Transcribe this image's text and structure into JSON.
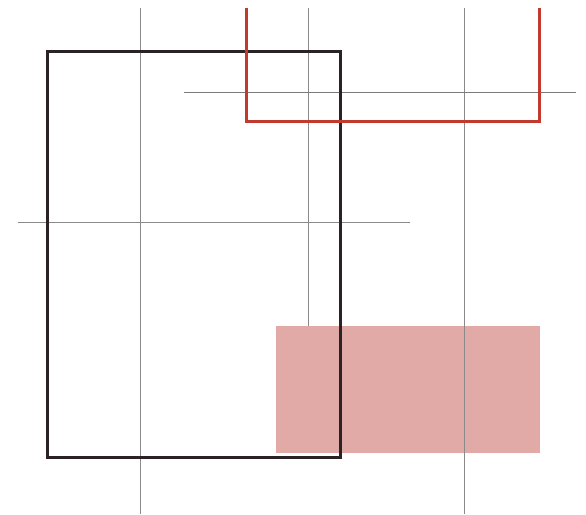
{
  "composition": {
    "title": "Abstract geometric composition",
    "background": "#ffffff",
    "colors": {
      "grid_line": "#8a8a8a",
      "black_frame": "#2a2224",
      "red_frame": "#c23a2e",
      "pink_fill": "#e2aaa6"
    },
    "shapes": [
      {
        "type": "vertical-line",
        "x": 140,
        "y1": 8,
        "y2": 514
      },
      {
        "type": "vertical-line",
        "x": 308,
        "y1": 8,
        "y2": 326
      },
      {
        "type": "vertical-line",
        "x": 464,
        "y1": 8,
        "y2": 514
      },
      {
        "type": "horizontal-line",
        "y": 92,
        "x1": 184,
        "x2": 576
      },
      {
        "type": "horizontal-line",
        "y": 222,
        "x1": 18,
        "x2": 410
      },
      {
        "type": "pink-rect",
        "x": 276,
        "y": 326,
        "w": 264,
        "h": 127
      },
      {
        "type": "black-rect-outline",
        "x": 47,
        "y": 51,
        "w": 291,
        "h": 404
      },
      {
        "type": "red-u-shape",
        "x": 246,
        "y_top": 8,
        "y_bottom": 121,
        "x_right": 537
      }
    ]
  }
}
